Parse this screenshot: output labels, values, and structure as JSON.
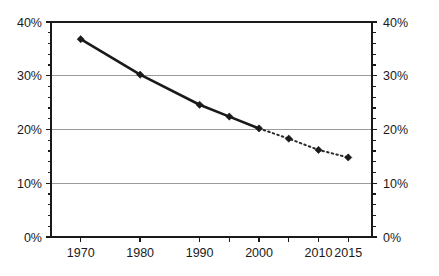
{
  "chart_data": {
    "type": "line",
    "title": "",
    "subtitle": "",
    "xlabel": "",
    "ylabel": "",
    "x": [
      1970,
      1980,
      1990,
      1995,
      2000,
      2005,
      2010,
      2015
    ],
    "values": [
      36.8,
      30.2,
      24.6,
      22.4,
      20.2,
      18.3,
      16.2,
      14.8
    ],
    "series": [
      {
        "name": "historical",
        "style": "solid",
        "x": [
          1970,
          1980,
          1990,
          1995,
          2000
        ],
        "values": [
          36.8,
          30.2,
          24.6,
          22.4,
          20.2
        ]
      },
      {
        "name": "projected",
        "style": "dotted",
        "x": [
          2000,
          2005,
          2010,
          2015
        ],
        "values": [
          20.2,
          18.3,
          16.2,
          14.8
        ]
      }
    ],
    "xlim": [
      1965,
      2019
    ],
    "ylim": [
      0,
      40
    ],
    "y_tick_step": 10,
    "y_minor_tick_step": 2,
    "grid": true,
    "grid_axis": "y",
    "legend": "none",
    "marker": "diamond",
    "dual_y_axis": true,
    "x_tick_positions": [
      1970,
      1980,
      1990,
      1995,
      2000,
      2005,
      2010,
      2015
    ],
    "x_tick_labels": [
      "1970",
      "1980",
      "1990",
      "",
      "2000",
      "",
      "2010",
      "2015"
    ],
    "y_tick_labels_left": [
      "0%",
      "10%",
      "20%",
      "30%",
      "40%"
    ],
    "y_tick_labels_right": [
      "0%",
      "10%",
      "20%",
      "30%",
      "40%"
    ],
    "colors": {
      "line": "#1a1a1a",
      "marker": "#1a1a1a",
      "grid": "#9a9a9a",
      "axis": "#1a1a1a",
      "background": "#ffffff"
    }
  }
}
